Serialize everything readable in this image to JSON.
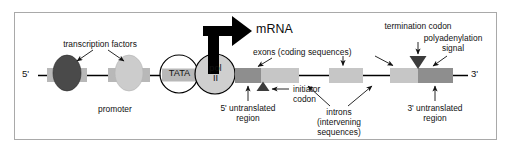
{
  "figure": {
    "title_visible": false,
    "background": "#ffffff",
    "frame_color": "#a9a9a9"
  },
  "palette": {
    "dark_gray": "#808080",
    "mid_gray": "#9c9c9c",
    "light_gray": "#c0c0c0",
    "pale_gray": "#cfcfcf",
    "tf_dark": "#4a4a4a",
    "tf_light": "#cccccc",
    "black": "#000000",
    "line": "#000000",
    "text": "#111111"
  },
  "strand": {
    "five_prime_label": "5'",
    "three_prime_label": "3'"
  },
  "labels": {
    "transcription_factors": "transcription factors",
    "promoter": "promoter",
    "tata": "TATA",
    "pol_line1": "pol",
    "pol_line2": "II",
    "mrna": "mRNA",
    "exons": "exons (coding sequences)",
    "termination_codon": "termination codon",
    "polyadenylation_line1": "polyadenylation",
    "polyadenylation_line2": "signal",
    "initiator_line1": "initiator",
    "initiator_line2": "codon",
    "five_utr_line1": "5' untranslated",
    "five_utr_line2": "region",
    "three_utr_line1": "3' untranslated",
    "three_utr_line2": "region",
    "introns_line1": "introns",
    "introns_line2": "(intervening",
    "introns_line3": "sequences)"
  },
  "elements": {
    "promoter_boxes": [
      {
        "name": "promoter-box-1",
        "x": 47,
        "y": 68,
        "w": 40,
        "h": 14,
        "fill": "#b8b8b8"
      },
      {
        "name": "promoter-box-2",
        "x": 108,
        "y": 68,
        "w": 42,
        "h": 14,
        "fill": "#b8b8b8"
      }
    ],
    "transcription_factor_ovals": [
      {
        "name": "transcription-factor-dark",
        "cx": 67,
        "cy": 73,
        "rx": 14,
        "ry": 18,
        "fill": "#4a4a4a"
      },
      {
        "name": "transcription-factor-light",
        "cx": 129,
        "cy": 73,
        "rx": 14,
        "ry": 18,
        "fill": "#cccccc"
      }
    ],
    "tata_circle": {
      "cx": 179,
      "cy": 74,
      "r": 19,
      "fill": "#ffffff"
    },
    "tata_box": {
      "x": 162,
      "y": 68,
      "w": 35,
      "h": 13,
      "fill": "#b8b8b8"
    },
    "pol_circle": {
      "cx": 215,
      "cy": 74,
      "r": 20,
      "fill": "#cfcfcf"
    },
    "gene_segments": [
      {
        "name": "five-prime-utr-block",
        "x": 235,
        "y": 68,
        "w": 26,
        "h": 15,
        "fill": "#8e8e8e"
      },
      {
        "name": "exon-1-block",
        "x": 261,
        "y": 68,
        "w": 38,
        "h": 15,
        "fill": "#c6c6c6"
      },
      {
        "name": "exon-2-block",
        "x": 329,
        "y": 68,
        "w": 34,
        "h": 15,
        "fill": "#c6c6c6"
      },
      {
        "name": "exon-3-block",
        "x": 390,
        "y": 68,
        "w": 28,
        "h": 15,
        "fill": "#c6c6c6"
      },
      {
        "name": "three-prime-utr-block",
        "x": 418,
        "y": 68,
        "w": 35,
        "h": 15,
        "fill": "#8e8e8e"
      }
    ],
    "intron_lines": [
      {
        "name": "intron-line-1",
        "x1": 299,
        "x2": 329,
        "y": 75.5
      },
      {
        "name": "intron-line-2",
        "x1": 363,
        "x2": 390,
        "y": 75.5
      }
    ],
    "initiator_triangle": {
      "name": "initiator-codon-marker",
      "cx": 263,
      "cy": 88,
      "w": 13,
      "h": 10,
      "fill": "#3c3c3c"
    },
    "termination_triangle": {
      "name": "termination-codon-marker",
      "cx": 418,
      "cy": 63,
      "w": 17,
      "h": 12,
      "fill": "#3c3c3c"
    },
    "mrna_arrow": {
      "name": "mrna-transcription-arrow",
      "fill": "#000000"
    }
  }
}
